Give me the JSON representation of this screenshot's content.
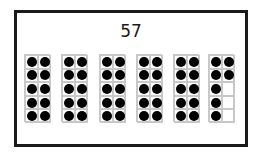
{
  "number": "57",
  "frames": [
    {
      "filled": 10
    },
    {
      "filled": 10
    },
    {
      "filled": 10
    },
    {
      "filled": 10
    },
    {
      "filled": 10
    },
    {
      "filled": 7,
      "cells": [
        1,
        1,
        1,
        1,
        1,
        0,
        1,
        0,
        1,
        0
      ]
    }
  ],
  "frame_left_offsets": [
    0,
    37,
    75,
    112,
    149,
    184
  ]
}
